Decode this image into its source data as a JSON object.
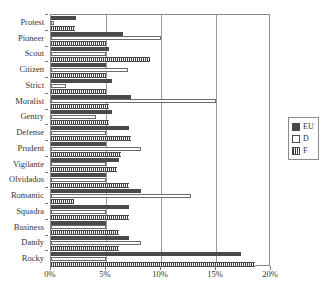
{
  "chart_data": {
    "type": "bar",
    "orientation": "horizontal",
    "title": "",
    "xlabel": "",
    "ylabel": "",
    "xlim": [
      0,
      20
    ],
    "xticks": [
      "0%",
      "5%",
      "10%",
      "15%",
      "20%"
    ],
    "xtick_values": [
      0,
      5,
      10,
      15,
      20
    ],
    "grid": true,
    "grid_axis": "x",
    "legend_position": "right",
    "categories": [
      "Protest",
      "Pioneer",
      "Scout",
      "Citizen",
      "Strict",
      "Moralist",
      "Gentry",
      "Defense",
      "Prudent",
      "Vigilante",
      "Olvidados",
      "Romantic",
      "Squadra",
      "Business",
      "Dandy",
      "Rocky"
    ],
    "series": [
      {
        "name": "EU",
        "values": [
          2.3,
          6.5,
          5.3,
          5.0,
          5.5,
          7.3,
          5.5,
          7.1,
          5.0,
          6.2,
          5.0,
          8.2,
          7.1,
          5.0,
          7.1,
          17.3
        ]
      },
      {
        "name": "D",
        "values": [
          0.3,
          10.0,
          5.0,
          7.0,
          1.4,
          15.0,
          4.1,
          5.0,
          8.2,
          5.0,
          5.0,
          12.7,
          5.0,
          5.0,
          8.2,
          5.0
        ]
      },
      {
        "name": "F",
        "values": [
          2.2,
          5.0,
          9.0,
          5.0,
          5.0,
          5.3,
          5.3,
          7.3,
          6.4,
          6.0,
          7.1,
          2.1,
          7.1,
          6.2,
          6.2,
          18.5
        ]
      }
    ]
  },
  "legend": {
    "entries": [
      {
        "label": "EU",
        "color": "#4a4a4a",
        "pattern": "solid"
      },
      {
        "label": "D",
        "color": "#ffffff",
        "pattern": "empty"
      },
      {
        "label": "F",
        "color": "#5a5a5a",
        "pattern": "hatched"
      }
    ]
  }
}
